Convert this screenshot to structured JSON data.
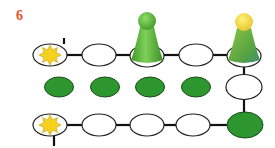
{
  "puzzle": {
    "number": "6",
    "colors": {
      "number": "#e2501f",
      "filled": "#2e962e",
      "outline": "#222222",
      "star": "#f5d21e",
      "pawn_green": "#5fba3c",
      "pawn_yellow_head": "#f3dc4a"
    },
    "rows": [
      {
        "name": "top-row",
        "nodes": [
          "star",
          "empty",
          "pawn-green",
          "empty",
          "pawn-yellow"
        ]
      },
      {
        "name": "middle-row",
        "nodes": [
          "filled",
          "filled",
          "filled",
          "filled",
          "empty"
        ]
      },
      {
        "name": "bottom-row",
        "nodes": [
          "star",
          "empty",
          "empty",
          "empty",
          "filled"
        ]
      }
    ],
    "icons": [
      "sun-star-icon",
      "green-pawn-icon",
      "yellow-green-pawn-icon"
    ]
  }
}
